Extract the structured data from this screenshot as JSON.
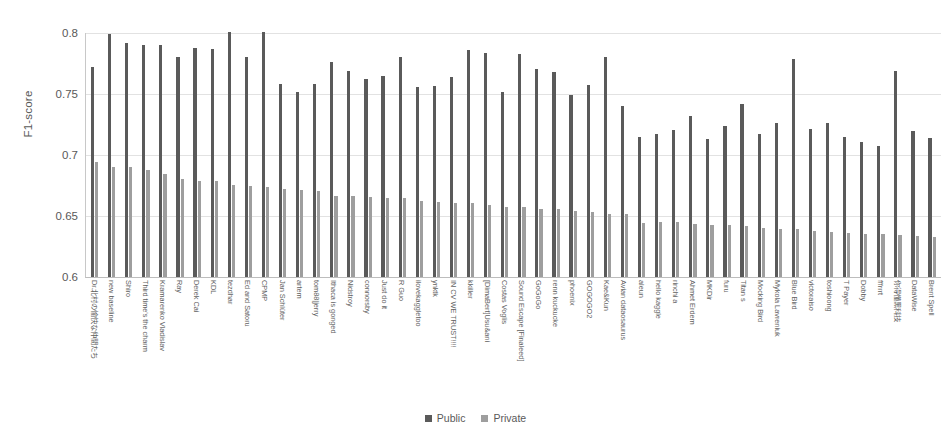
{
  "chart_data": {
    "type": "bar",
    "title": "",
    "xlabel": "",
    "ylabel": "F1-score",
    "ylim": [
      0.6,
      0.8
    ],
    "yticks": [
      0.6,
      0.65,
      0.7,
      0.75,
      0.8
    ],
    "ytick_labels": [
      "0.6",
      "0.65",
      "0.7",
      "0.75",
      "0.8"
    ],
    "grid": true,
    "legend_position": "bottom",
    "legend": [
      "Public",
      "Private"
    ],
    "colors": {
      "public": "#5a5a5a",
      "private": "#9e9e9e"
    },
    "categories": [
      "Dr.北村の愉快な仲間たち",
      "new baseline",
      "Shiro",
      "Third time's the charm",
      "Kramarenko Vladislav",
      "Ray",
      "Derek Cai",
      "KDL",
      "tezdhar",
      "Ed and Satoru",
      "CPMP",
      "Jan Schlüter",
      "artem",
      "tom88|jerry",
      "Ithaca is gonged",
      "Nidstroy",
      "connorsby",
      "Just do it",
      "R Guo",
      "ilovekaggletoo",
      "ynktk",
      "IN CV WE TRUST!!!!",
      "kkiller",
      "[DimaBert]Usu&ani",
      "Costas Voglis",
      "Sound Escape [Finaleed]",
      "GoGoGo",
      "renn kuckucke",
      "phoenix",
      "GOGOGO2",
      "Kae&Kun",
      "Avian dataosaurus",
      "aleun",
      "hello kaggle",
      "rinchi a",
      "Ahmet Erdem",
      "MKDir",
      "furu",
      "Titan s",
      "Mocking Bird",
      "Mykola Lavreniuk",
      "Blue Bird",
      "victoraiso",
      "toshioong",
      "T Payer",
      "Dobby",
      "fffrrrt",
      "你得懂黑科技",
      "DataWise",
      "Brent Spell"
    ],
    "series": [
      {
        "name": "Public",
        "values": [
          0.7725,
          0.7995,
          0.792,
          0.7905,
          0.7905,
          0.78,
          0.788,
          0.7865,
          0.801,
          0.7805,
          0.8005,
          0.7585,
          0.752,
          0.7585,
          0.776,
          0.769,
          0.762,
          0.7645,
          0.7805,
          0.756,
          0.7565,
          0.764,
          0.786,
          0.784,
          0.752,
          0.783,
          0.7705,
          0.768,
          0.749,
          0.757,
          0.78,
          0.74,
          0.7145,
          0.717,
          0.7205,
          0.732,
          0.713,
          0.724,
          0.742,
          0.7175,
          0.7265,
          0.779,
          0.7215,
          0.726,
          0.715,
          0.7105,
          0.7075,
          0.769,
          0.72,
          0.714
        ]
      },
      {
        "name": "Private",
        "values": [
          0.694,
          0.6905,
          0.69,
          0.688,
          0.6845,
          0.6805,
          0.679,
          0.6785,
          0.6755,
          0.6745,
          0.674,
          0.6725,
          0.6715,
          0.6705,
          0.6665,
          0.666,
          0.6655,
          0.665,
          0.6645,
          0.662,
          0.6615,
          0.661,
          0.6605,
          0.659,
          0.6575,
          0.657,
          0.656,
          0.6555,
          0.6545,
          0.653,
          0.652,
          0.6515,
          0.6445,
          0.6455,
          0.645,
          0.6435,
          0.643,
          0.6425,
          0.642,
          0.64,
          0.6395,
          0.639,
          0.6375,
          0.637,
          0.636,
          0.6355,
          0.635,
          0.6345,
          0.6335,
          0.633
        ]
      }
    ]
  }
}
